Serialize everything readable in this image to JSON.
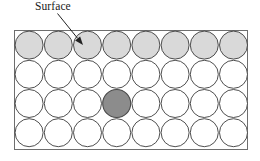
{
  "figure": {
    "background_color": "#ffffff",
    "annotation": {
      "label": "Surface",
      "arrow": {
        "name": "surface-arrow",
        "start_x": 57.5,
        "start_y": 13.5,
        "end_x": 83,
        "end_y": 45,
        "color": "#222222",
        "line_width": 1
      }
    },
    "box": {
      "x": 14.5,
      "y": 30.5,
      "width": 233,
      "height": 119,
      "stroke": "#6e6e6e",
      "stroke_width": 1,
      "fill": "#ffffff"
    },
    "lattice": {
      "columns": 8,
      "rows": 4,
      "circle_diameter": 29.2,
      "circle_radius": 14.6,
      "origin_x": 14.5,
      "origin_y": 30.5,
      "outline_color": "#3b3b3b",
      "outline_width": 0.9,
      "default_fill": "#ffffff",
      "surface_row_index": 0,
      "surface_fill": "#d9d9d9",
      "highlight": {
        "name": "impurity-atom",
        "row": 2,
        "column": 3,
        "fill": "#8c8c8c",
        "outline_color": "#4a4a4a",
        "outline_width": 1.1
      }
    }
  }
}
